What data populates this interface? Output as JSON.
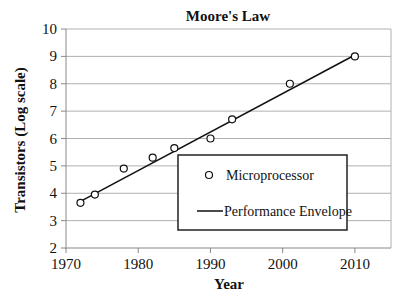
{
  "chart_data": {
    "type": "scatter",
    "title": "Moore's Law",
    "xlabel": "Year",
    "ylabel": "Transistors (Log scale)",
    "xlim": [
      1970,
      2015
    ],
    "ylim": [
      2,
      10
    ],
    "xticks": [
      1970,
      1980,
      1990,
      2000,
      2010
    ],
    "yticks": [
      2,
      3,
      4,
      5,
      6,
      7,
      8,
      9,
      10
    ],
    "grid": "horizontal",
    "legend_position": "inside lower right",
    "series": [
      {
        "name": "Microprocessor",
        "type": "scatter",
        "marker": "open-circle",
        "x": [
          1972,
          1974,
          1978,
          1982,
          1985,
          1990,
          1993,
          2001,
          2010
        ],
        "y": [
          3.65,
          3.95,
          4.9,
          5.3,
          5.65,
          6.0,
          6.7,
          8.0,
          9.0
        ]
      },
      {
        "name": "Performance Envelope",
        "type": "line",
        "x": [
          1972,
          2010
        ],
        "y": [
          3.7,
          9.05
        ]
      }
    ]
  },
  "colors": {
    "grid": "#b0b0b0",
    "axis": "#888888",
    "series": "#111111",
    "legend_border": "#222222"
  }
}
